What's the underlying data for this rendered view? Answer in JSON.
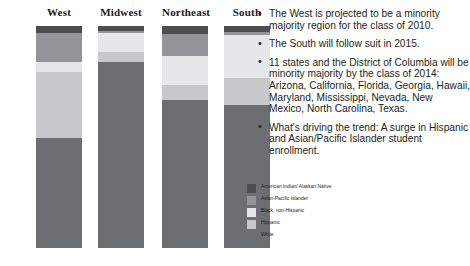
{
  "bullets": [
    "The West is projected to be a minority majority region for the class of 2010.",
    "The South will follow suit in 2015.",
    "11 states and the District of Columbia will be minority majority by the class of 2014: Arizona, California, Florida, Georgia, Hawaii, Maryland, Mississippi, Nevada, New Mexico, North Carolina, Texas.",
    "What's driving the trend: A surge in Hispanic and Asian/Pacific Islander student enrollment."
  ],
  "legend": {
    "items": [
      {
        "label": "American Indian/ Alaskan Native",
        "color": "#4d4d4f"
      },
      {
        "label": "Asian-Pacific Islander",
        "color": "#939598"
      },
      {
        "label": "Black, non-Hispanic",
        "color": "#e6e7e8"
      },
      {
        "label": "Hispanic",
        "color": "#c7c8ca"
      },
      {
        "label": "White",
        "color": "#6d6e71"
      }
    ]
  },
  "chart_data": {
    "type": "bar",
    "title": "",
    "xlabel": "",
    "ylabel": "",
    "ylim": [
      0,
      100
    ],
    "categories": [
      "West",
      "Midwest",
      "Northeast",
      "South"
    ],
    "series": [
      {
        "name": "American Indian/ Alaskan Native",
        "color": "#4d4d4f",
        "values": [
          3,
          2,
          4,
          3
        ]
      },
      {
        "name": "Asian-Pacific Islander",
        "color": "#939598",
        "values": [
          13,
          0,
          10,
          0
        ]
      },
      {
        "name": "Black, non-Hispanic",
        "color": "#e6e7e8",
        "values": [
          5,
          10,
          13,
          21
        ]
      },
      {
        "name": "Hispanic",
        "color": "#c7c8ca",
        "values": [
          29,
          4,
          7,
          12
        ]
      },
      {
        "name": "White",
        "color": "#6d6e71",
        "values": [
          50,
          84,
          66,
          64
        ]
      }
    ]
  },
  "bars": [
    {
      "label": "West",
      "left": 36,
      "width": 46,
      "segments": [
        {
          "name": "American Indian/ Alaskan Native",
          "top": 0,
          "height": 7,
          "color": "#4d4d4f"
        },
        {
          "name": "Asian-Pacific Islander",
          "top": 7,
          "height": 29,
          "color": "#939598"
        },
        {
          "name": "Black, non-Hispanic",
          "top": 36,
          "height": 10,
          "color": "#e6e7e8"
        },
        {
          "name": "Hispanic",
          "top": 46,
          "height": 66,
          "color": "#c7c8ca"
        },
        {
          "name": "White",
          "top": 112,
          "height": 110,
          "color": "#6d6e71"
        }
      ]
    },
    {
      "label": "Midwest",
      "left": 98,
      "width": 46,
      "segments": [
        {
          "name": "American Indian/ Alaskan Native",
          "top": 0,
          "height": 5,
          "color": "#4d4d4f"
        },
        {
          "name": "Asian-Pacific Islander",
          "top": 5,
          "height": 2,
          "color": "#939598"
        },
        {
          "name": "Black, non-Hispanic",
          "top": 7,
          "height": 19,
          "color": "#e6e7e8"
        },
        {
          "name": "Hispanic",
          "top": 26,
          "height": 10,
          "color": "#c7c8ca"
        },
        {
          "name": "White",
          "top": 36,
          "height": 186,
          "color": "#6d6e71"
        }
      ]
    },
    {
      "label": "Northeast",
      "left": 162,
      "width": 46,
      "segments": [
        {
          "name": "American Indian/ Alaskan Native",
          "top": 0,
          "height": 8,
          "color": "#4d4d4f"
        },
        {
          "name": "Asian-Pacific Islander",
          "top": 8,
          "height": 22,
          "color": "#939598"
        },
        {
          "name": "Black, non-Hispanic",
          "top": 30,
          "height": 29,
          "color": "#e6e7e8"
        },
        {
          "name": "Hispanic",
          "top": 59,
          "height": 15,
          "color": "#c7c8ca"
        },
        {
          "name": "White",
          "top": 74,
          "height": 148,
          "color": "#6d6e71"
        }
      ]
    },
    {
      "label": "South",
      "left": 224,
      "width": 46,
      "segments": [
        {
          "name": "American Indian/ Alaskan Native",
          "top": 0,
          "height": 6,
          "color": "#4d4d4f"
        },
        {
          "name": "Asian-Pacific Islander",
          "top": 6,
          "height": 3,
          "color": "#939598"
        },
        {
          "name": "Black, non-Hispanic",
          "top": 9,
          "height": 43,
          "color": "#e6e7e8"
        },
        {
          "name": "Hispanic",
          "top": 52,
          "height": 27,
          "color": "#c7c8ca"
        },
        {
          "name": "White",
          "top": 79,
          "height": 143,
          "color": "#6d6e71"
        }
      ]
    }
  ]
}
